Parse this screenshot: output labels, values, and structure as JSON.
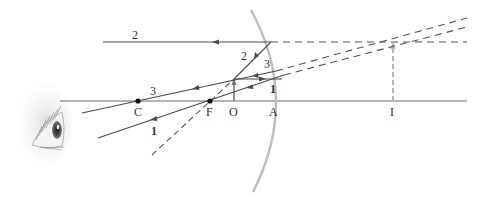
{
  "diagram": {
    "type": "convex-mirror ray diagram (virtual image)",
    "colors": {
      "ray": "#4a4a4a",
      "dashed_ray": "#555555",
      "mirror": "#bdbdbd",
      "axis": "#6a6a6a",
      "image": "#b5b5b5",
      "object": "#777777",
      "point": "#111111"
    },
    "points": {
      "C": "C",
      "F": "F",
      "O": "O",
      "A": "A",
      "I": "I"
    },
    "ray_labels": {
      "ray2_outer": "2",
      "ray2_inner": "2",
      "ray3_outer": "3",
      "ray3_inner": "3",
      "ray1_outer": "1",
      "ray1_inner": "1"
    },
    "icons": {
      "eye": "eye-illustration"
    }
  }
}
